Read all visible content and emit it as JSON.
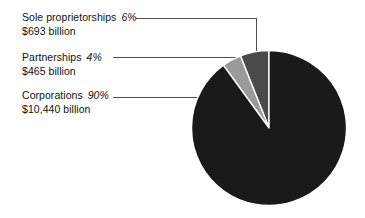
{
  "chart_data": {
    "type": "pie",
    "title": "",
    "subtitle": "",
    "xlabel": "",
    "ylabel": "",
    "legend_position": "left-callouts",
    "grid": false,
    "start_angle_deg": 90,
    "direction": "counterclockwise",
    "categories": [
      "Sole proprietorships",
      "Partnerships",
      "Corporations"
    ],
    "values": [
      6,
      4,
      90
    ],
    "value_unit": "percent",
    "amounts": [
      693,
      465,
      10440
    ],
    "amount_unit": "billion dollars",
    "slice_colors": [
      "#4a4a4a",
      "#9a9a9a",
      "#1a1a1a"
    ],
    "separator_color": "#ffffff",
    "slices": [
      {
        "name": "Sole proprietorships",
        "percent": 6,
        "percent_label": "6%",
        "amount_label": "$693 billion",
        "color": "#4a4a4a"
      },
      {
        "name": "Partnerships",
        "percent": 4,
        "percent_label": "4%",
        "amount_label": "$465 billion",
        "color": "#9a9a9a"
      },
      {
        "name": "Corporations",
        "percent": 90,
        "percent_label": "90%",
        "amount_label": "$10,440 billion",
        "color": "#1a1a1a"
      }
    ]
  },
  "labels": {
    "sole": {
      "name": "Sole proprietorships",
      "percent": "6%",
      "amount": "$693 billion"
    },
    "partnerships": {
      "name": "Partnerships",
      "percent": "4%",
      "amount": "$465 billion"
    },
    "corporations": {
      "name": "Corporations",
      "percent": "90%",
      "amount": "$10,440 billion"
    }
  },
  "colors": {
    "background": "#ffffff",
    "text": "#121212",
    "leader_line": "#4d4d4d",
    "slice_sole": "#4a4a4a",
    "slice_partnerships": "#9a9a9a",
    "slice_corporations": "#1a1a1a",
    "slice_separator": "#ffffff"
  }
}
